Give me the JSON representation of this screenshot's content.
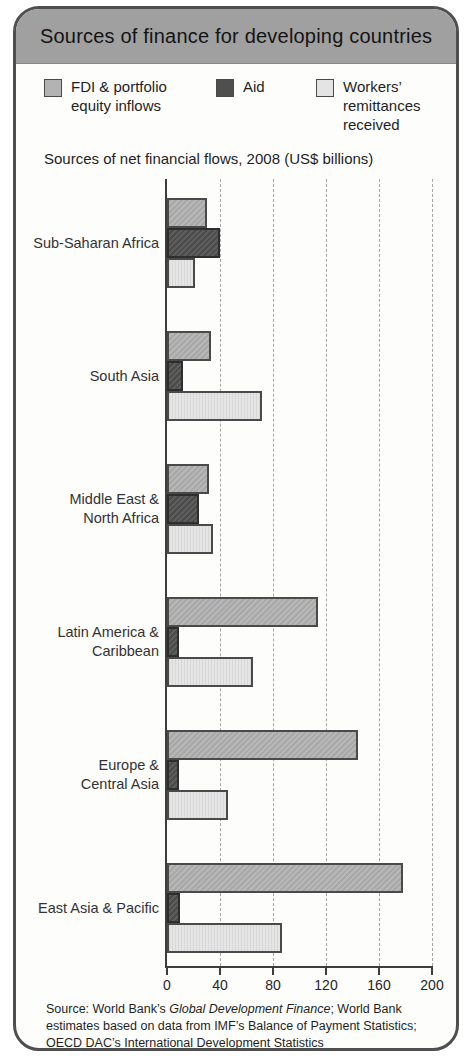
{
  "card": {
    "title": "Sources of finance for developing countries",
    "subtitle": "Sources of net financial flows, 2008 (US$ billions)",
    "source": {
      "prefix": "Source: World Bank’s ",
      "italic": "Global Development Finance",
      "suffix": "; World Bank estimates based on data from IMF’s Balance of Payment Statistics; OECD DAC’s International Development Statistics"
    }
  },
  "legend": [
    {
      "label": "FDI & portfolio equity inflows",
      "color": "#b3b3b3"
    },
    {
      "label": "Aid",
      "color": "#4f4f4f"
    },
    {
      "label": "Workers’ remittances received",
      "color": "#e4e4e4"
    }
  ],
  "colors": {
    "header_band": "#a0a0a0",
    "card_border": "#4f4f4f",
    "axis": "#3d3d3d",
    "gridline": "#a6a6a6"
  },
  "chart_data": {
    "type": "bar",
    "orientation": "horizontal",
    "title": "Sources of net financial flows, 2008 (US$ billions)",
    "xlabel": "US$ billions",
    "ylabel": "",
    "xlim": [
      0,
      200
    ],
    "xticks": [
      0,
      40,
      80,
      120,
      160,
      200
    ],
    "grid": "vertical-dashed",
    "legend_position": "top",
    "categories": [
      [
        "Sub-Saharan Africa"
      ],
      [
        "South Asia"
      ],
      [
        "Middle East &",
        "North Africa"
      ],
      [
        "Latin America &",
        "Caribbean"
      ],
      [
        "Europe &",
        "Central Asia"
      ],
      [
        "East Asia & Pacific"
      ]
    ],
    "series": [
      {
        "name": "FDI & portfolio equity inflows",
        "color": "#b3b3b3",
        "values": [
          30,
          33,
          32,
          114,
          144,
          178
        ]
      },
      {
        "name": "Aid",
        "color": "#4f4f4f",
        "values": [
          40,
          12,
          24,
          9,
          9,
          10
        ]
      },
      {
        "name": "Workers’ remittances received",
        "color": "#e4e4e4",
        "values": [
          21,
          72,
          35,
          65,
          46,
          87
        ]
      }
    ]
  }
}
